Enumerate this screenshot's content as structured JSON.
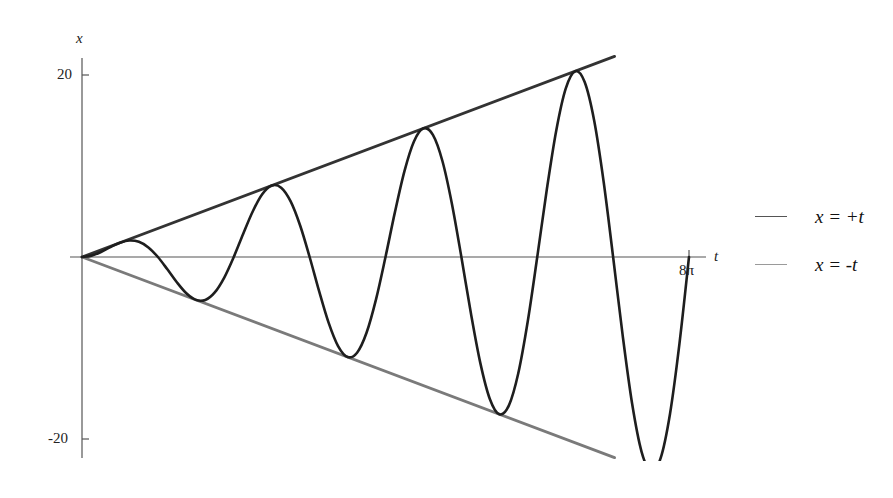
{
  "chart_data": {
    "type": "line",
    "title": "",
    "xlabel": "t",
    "ylabel": "x",
    "xlim": [
      0,
      25.1327
    ],
    "ylim": [
      -22.4,
      22.0
    ],
    "x_ticks": [
      {
        "value": 25.1327,
        "label": "8π"
      }
    ],
    "y_ticks": [
      {
        "value": 20,
        "label": "20"
      },
      {
        "value": -20,
        "label": "-20"
      }
    ],
    "grid": false,
    "legend_position": "right",
    "series": [
      {
        "name": "x = t sin t",
        "color": "#1e1e1e",
        "width": 2.6,
        "in_legend": false,
        "t_step": "π/8",
        "t": [
          0,
          0.3927,
          0.7854,
          1.1781,
          1.5708,
          1.9635,
          2.3562,
          2.7489,
          3.1416,
          3.5343,
          3.927,
          4.3197,
          4.7124,
          5.1051,
          5.4978,
          5.8905,
          6.2832,
          6.6759,
          7.0686,
          7.4613,
          7.854,
          8.2467,
          8.6394,
          9.0321,
          9.4248,
          9.8175,
          10.2102,
          10.6029,
          10.9956,
          11.3883,
          11.781,
          12.1737,
          12.5664,
          12.9591,
          13.3518,
          13.7445,
          14.1372,
          14.5299,
          14.9226,
          15.3153,
          15.708,
          16.1007,
          16.4934,
          16.8861,
          17.2788,
          17.6715,
          18.0642,
          18.4569,
          18.8496,
          19.2423,
          19.635,
          20.0277,
          20.4204,
          20.8131,
          21.2058,
          21.5985,
          21.9911,
          22.3839,
          22.7766,
          23.1693,
          23.5619,
          23.9547,
          24.3474,
          24.7401,
          25.1327
        ],
        "values": [
          0,
          0.15,
          0.555,
          1.088,
          1.571,
          1.814,
          1.666,
          1.052,
          0,
          -1.353,
          -2.777,
          -3.991,
          -4.712,
          -4.717,
          -3.888,
          -2.254,
          0,
          2.555,
          4.998,
          6.893,
          7.854,
          7.619,
          6.109,
          3.457,
          0,
          -3.757,
          -7.22,
          -9.796,
          -10.996,
          -10.522,
          -8.33,
          -4.659,
          0,
          4.959,
          9.441,
          12.698,
          14.137,
          13.424,
          10.552,
          5.861,
          0,
          -6.162,
          -11.663,
          -15.601,
          -17.279,
          -16.327,
          -12.773,
          -7.063,
          0,
          7.364,
          13.884,
          18.504,
          20.42,
          19.229,
          14.995,
          8.266,
          0,
          -8.566,
          -16.105,
          -21.406,
          -23.562,
          -22.132,
          -17.216,
          -9.468,
          0
        ]
      },
      {
        "name": "x = +t",
        "color": "#333333",
        "width": 2.8,
        "in_legend": true,
        "t": [
          0,
          22.05
        ],
        "values": [
          0,
          22.05
        ]
      },
      {
        "name": "x = -t",
        "color": "#7a7a7a",
        "width": 2.8,
        "in_legend": true,
        "t": [
          0,
          22.05
        ],
        "values": [
          0,
          -22.05
        ]
      }
    ]
  },
  "axes": {
    "x_label": "t",
    "y_label": "x",
    "x_tick_label": "8π",
    "y_tick_top": "20",
    "y_tick_bottom": "-20"
  },
  "legend": {
    "items": [
      {
        "label": "x = +t",
        "color": "#555555"
      },
      {
        "label": "x = -t",
        "color": "#9a9a9a"
      }
    ]
  }
}
